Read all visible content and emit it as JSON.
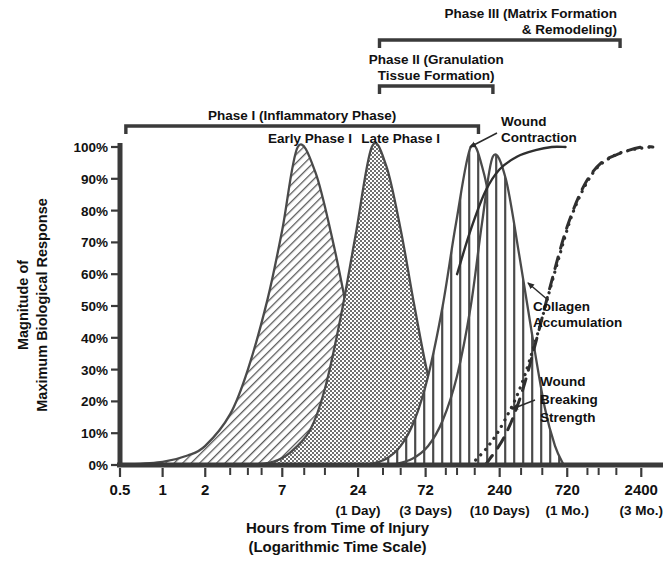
{
  "figure": {
    "title_absent": true,
    "background": "#ffffff",
    "ink": "#3a3a3a"
  },
  "chart_data": {
    "type": "area",
    "title": "",
    "xlabel": "Hours from Time of Injury",
    "xlabel_sub": "(Logarithmic Time Scale)",
    "ylabel_line1": "Magnitude of",
    "ylabel_line2": "Maximum Biological Response",
    "xscale": "log",
    "xlim": [
      0.5,
      3000
    ],
    "ylim": [
      0,
      100
    ],
    "grid": false,
    "legend": "inline-annotations",
    "x_ticks": [
      {
        "value": 0.5,
        "label": "0.5",
        "sublabel": ""
      },
      {
        "value": 1,
        "label": "1",
        "sublabel": ""
      },
      {
        "value": 2,
        "label": "2",
        "sublabel": ""
      },
      {
        "value": 7,
        "label": "7",
        "sublabel": ""
      },
      {
        "value": 24,
        "label": "24",
        "sublabel": "(1 Day)"
      },
      {
        "value": 72,
        "label": "72",
        "sublabel": "(3 Days)"
      },
      {
        "value": 240,
        "label": "240",
        "sublabel": "(10 Days)"
      },
      {
        "value": 720,
        "label": "720",
        "sublabel": "(1 Mo.)"
      },
      {
        "value": 2400,
        "label": "2400",
        "sublabel": "(3 Mo.)"
      }
    ],
    "x_minor_ticks": [
      3,
      4,
      5,
      10,
      14,
      36,
      48,
      100,
      120,
      160,
      340,
      480,
      1000,
      1200,
      1600
    ],
    "y_ticks": [
      {
        "value": 0,
        "label": "0%"
      },
      {
        "value": 10,
        "label": "10%"
      },
      {
        "value": 20,
        "label": "20%"
      },
      {
        "value": 30,
        "label": "30%"
      },
      {
        "value": 40,
        "label": "40%"
      },
      {
        "value": 50,
        "label": "50%"
      },
      {
        "value": 60,
        "label": "60%"
      },
      {
        "value": 70,
        "label": "70%"
      },
      {
        "value": 80,
        "label": "80%"
      },
      {
        "value": 90,
        "label": "90%"
      },
      {
        "value": 100,
        "label": "100%"
      }
    ],
    "series": [
      {
        "name": "early-inflammatory-peak",
        "label": "",
        "style": "diagonal-hatch",
        "peak_hours": 9,
        "peak_value": 100,
        "log_sigma": 0.3,
        "points": [
          {
            "x": 0.5,
            "y": 0
          },
          {
            "x": 1,
            "y": 1
          },
          {
            "x": 1.5,
            "y": 3
          },
          {
            "x": 2,
            "y": 6
          },
          {
            "x": 3,
            "y": 16
          },
          {
            "x": 4,
            "y": 30
          },
          {
            "x": 5.5,
            "y": 52
          },
          {
            "x": 7,
            "y": 74
          },
          {
            "x": 9,
            "y": 100
          },
          {
            "x": 12,
            "y": 92
          },
          {
            "x": 16,
            "y": 70
          },
          {
            "x": 21,
            "y": 45
          },
          {
            "x": 28,
            "y": 24
          },
          {
            "x": 38,
            "y": 11
          },
          {
            "x": 52,
            "y": 4
          },
          {
            "x": 72,
            "y": 1
          },
          {
            "x": 95,
            "y": 0
          }
        ]
      },
      {
        "name": "late-inflammatory-peak",
        "label": "",
        "style": "stipple",
        "peak_hours": 30,
        "peak_value": 100,
        "log_sigma": 0.285,
        "points": [
          {
            "x": 4,
            "y": 0
          },
          {
            "x": 6,
            "y": 1
          },
          {
            "x": 8,
            "y": 4
          },
          {
            "x": 11,
            "y": 11
          },
          {
            "x": 14,
            "y": 24
          },
          {
            "x": 18,
            "y": 46
          },
          {
            "x": 23,
            "y": 72
          },
          {
            "x": 30,
            "y": 100
          },
          {
            "x": 38,
            "y": 94
          },
          {
            "x": 48,
            "y": 74
          },
          {
            "x": 60,
            "y": 50
          },
          {
            "x": 75,
            "y": 28
          },
          {
            "x": 95,
            "y": 12
          },
          {
            "x": 120,
            "y": 4
          },
          {
            "x": 150,
            "y": 1
          },
          {
            "x": 190,
            "y": 0
          }
        ]
      },
      {
        "name": "fibroblast-proliferation-peak",
        "label": "",
        "style": "vertical-line-hatch",
        "peak_hours": 150,
        "peak_value": 100,
        "log_sigma": 0.24,
        "points": [
          {
            "x": 28,
            "y": 0
          },
          {
            "x": 38,
            "y": 2
          },
          {
            "x": 48,
            "y": 6
          },
          {
            "x": 60,
            "y": 14
          },
          {
            "x": 75,
            "y": 28
          },
          {
            "x": 95,
            "y": 50
          },
          {
            "x": 118,
            "y": 76
          },
          {
            "x": 150,
            "y": 100
          },
          {
            "x": 185,
            "y": 92
          },
          {
            "x": 230,
            "y": 70
          },
          {
            "x": 290,
            "y": 44
          },
          {
            "x": 360,
            "y": 22
          },
          {
            "x": 440,
            "y": 9
          },
          {
            "x": 540,
            "y": 2
          },
          {
            "x": 640,
            "y": 0
          }
        ]
      },
      {
        "name": "collagen-synthesis-peak",
        "label": "",
        "style": "vertical-line-hatch",
        "peak_hours": 215,
        "peak_value": 97,
        "log_sigma": 0.235,
        "points": [
          {
            "x": 42,
            "y": 0
          },
          {
            "x": 58,
            "y": 2
          },
          {
            "x": 75,
            "y": 6
          },
          {
            "x": 95,
            "y": 14
          },
          {
            "x": 120,
            "y": 28
          },
          {
            "x": 150,
            "y": 50
          },
          {
            "x": 180,
            "y": 76
          },
          {
            "x": 215,
            "y": 97
          },
          {
            "x": 265,
            "y": 90
          },
          {
            "x": 330,
            "y": 66
          },
          {
            "x": 410,
            "y": 40
          },
          {
            "x": 500,
            "y": 18
          },
          {
            "x": 590,
            "y": 6
          },
          {
            "x": 680,
            "y": 0
          }
        ]
      },
      {
        "name": "wound-contraction",
        "label": "Wound Contraction",
        "style": "solid-line",
        "points": [
          {
            "x": 120,
            "y": 60
          },
          {
            "x": 150,
            "y": 74
          },
          {
            "x": 190,
            "y": 86
          },
          {
            "x": 240,
            "y": 93
          },
          {
            "x": 320,
            "y": 97
          },
          {
            "x": 430,
            "y": 99
          },
          {
            "x": 560,
            "y": 100
          },
          {
            "x": 700,
            "y": 100
          }
        ]
      },
      {
        "name": "collagen-accumulation",
        "label": "Collagen Accumulation",
        "style": "dotted-line",
        "points": [
          {
            "x": 150,
            "y": 0
          },
          {
            "x": 200,
            "y": 6
          },
          {
            "x": 260,
            "y": 14
          },
          {
            "x": 340,
            "y": 25
          },
          {
            "x": 450,
            "y": 42
          },
          {
            "x": 600,
            "y": 62
          },
          {
            "x": 800,
            "y": 80
          },
          {
            "x": 1100,
            "y": 92
          },
          {
            "x": 1500,
            "y": 97
          },
          {
            "x": 2000,
            "y": 99
          },
          {
            "x": 2800,
            "y": 100
          }
        ]
      },
      {
        "name": "wound-breaking-strength",
        "label": "Wound Breaking Strength",
        "style": "dashed-line",
        "points": [
          {
            "x": 190,
            "y": 0
          },
          {
            "x": 260,
            "y": 9
          },
          {
            "x": 340,
            "y": 22
          },
          {
            "x": 440,
            "y": 40
          },
          {
            "x": 560,
            "y": 58
          },
          {
            "x": 720,
            "y": 75
          },
          {
            "x": 950,
            "y": 88
          },
          {
            "x": 1250,
            "y": 95
          },
          {
            "x": 1700,
            "y": 98
          },
          {
            "x": 2400,
            "y": 100
          },
          {
            "x": 2900,
            "y": 100
          }
        ]
      }
    ],
    "phase_brackets": [
      {
        "name": "phase-1",
        "label": "Phase I (Inflammatory Phase)",
        "start_hours": 0.55,
        "end_hours": 170,
        "sub_labels": [
          {
            "name": "early-phase-1",
            "label": "Early Phase I",
            "center_hours": 11
          },
          {
            "name": "late-phase-1",
            "label": "Late Phase I",
            "center_hours": 48
          }
        ]
      },
      {
        "name": "phase-2",
        "label_line1": "Phase II (Granulation",
        "label_line2": "Tissue Formation)",
        "start_hours": 34,
        "end_hours": 215
      },
      {
        "name": "phase-3",
        "label_line1": "Phase III (Matrix Formation",
        "label_line2": "& Remodeling)",
        "start_hours": 34,
        "end_hours": 1700
      }
    ],
    "annotations": [
      {
        "name": "wound-contraction-annotation",
        "line1": "Wound",
        "line2": "Contraction",
        "line3": ""
      },
      {
        "name": "collagen-accumulation-annotation",
        "line1": "Collagen",
        "line2": "Accumulation",
        "line3": ""
      },
      {
        "name": "wound-breaking-strength-annotation",
        "line1": "Wound",
        "line2": "Breaking",
        "line3": "Strength"
      }
    ]
  }
}
